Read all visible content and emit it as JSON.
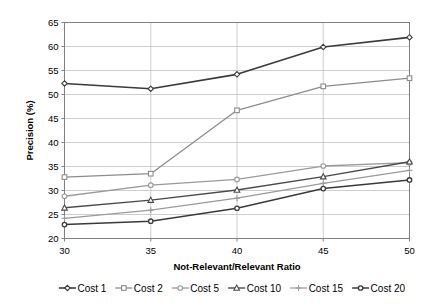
{
  "chart_data": {
    "type": "line",
    "title": "",
    "xlabel": "Not-Relevant/Relevant Ratio",
    "ylabel": "Precision (%)",
    "x": [
      30,
      35,
      40,
      45,
      50
    ],
    "xticklabels": [
      "30",
      "35",
      "40",
      "45",
      "50"
    ],
    "yticklabels": [
      "20",
      "25",
      "30",
      "35",
      "40",
      "45",
      "50",
      "55",
      "60",
      "65"
    ],
    "xlim": [
      30,
      50
    ],
    "ylim": [
      20,
      65
    ],
    "ytick_step": 5,
    "grid": "horizontal-and-vertical",
    "legend_position": "bottom",
    "series": [
      {
        "name": "Cost 1",
        "marker": "diamond",
        "color": "#3a3a3a",
        "width": 1.6,
        "values": [
          52.3,
          51.2,
          54.2,
          59.9,
          61.9
        ]
      },
      {
        "name": "Cost 2",
        "marker": "square",
        "color": "#8c8c8c",
        "width": 1.3,
        "values": [
          32.8,
          33.5,
          46.7,
          51.7,
          53.4
        ]
      },
      {
        "name": "Cost 5",
        "marker": "circle",
        "color": "#9a9a9a",
        "width": 1.3,
        "values": [
          28.8,
          31.1,
          32.3,
          35.1,
          35.8
        ]
      },
      {
        "name": "Cost 10",
        "marker": "triangle",
        "color": "#4a4a4a",
        "width": 1.4,
        "values": [
          26.4,
          28.0,
          30.1,
          32.9,
          36.0
        ]
      },
      {
        "name": "Cost 15",
        "marker": "plus",
        "color": "#9a9a9a",
        "width": 1.2,
        "values": [
          24.2,
          25.9,
          28.4,
          31.5,
          34.2
        ]
      },
      {
        "name": "Cost 20",
        "marker": "circle-filled",
        "color": "#3a3a3a",
        "width": 1.5,
        "values": [
          22.9,
          23.6,
          26.3,
          30.4,
          32.2
        ]
      }
    ]
  },
  "legend": {
    "items": [
      {
        "label": "Cost 1"
      },
      {
        "label": "Cost 2"
      },
      {
        "label": "Cost 5"
      },
      {
        "label": "Cost 10"
      },
      {
        "label": "Cost 15"
      },
      {
        "label": "Cost 20"
      }
    ]
  }
}
